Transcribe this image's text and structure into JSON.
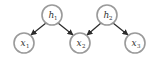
{
  "diagram": {
    "type": "directed-graphical-model",
    "colors": {
      "node_stroke": "#9a9a9a",
      "node_fill": "#ffffff",
      "edge": "#2b2b2b",
      "text": "#333333"
    },
    "nodes": [
      {
        "id": "h1",
        "base": "h",
        "sub": "1",
        "cx": 52,
        "cy": 15
      },
      {
        "id": "h2",
        "base": "h",
        "sub": "2",
        "cx": 107,
        "cy": 15
      },
      {
        "id": "x1",
        "base": "x",
        "sub": "1",
        "cx": 24,
        "cy": 43
      },
      {
        "id": "x2",
        "base": "x",
        "sub": "2",
        "cx": 80,
        "cy": 43
      },
      {
        "id": "x3",
        "base": "x",
        "sub": "3",
        "cx": 135,
        "cy": 43
      }
    ],
    "edges": [
      {
        "from": "h1",
        "to": "x1"
      },
      {
        "from": "h1",
        "to": "x2"
      },
      {
        "from": "h2",
        "to": "x2"
      },
      {
        "from": "h2",
        "to": "x3"
      }
    ]
  }
}
